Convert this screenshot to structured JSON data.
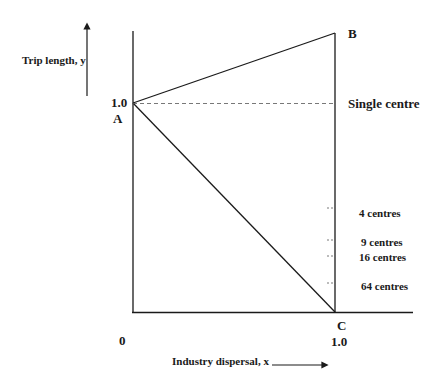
{
  "diagram": {
    "y_axis_label": "Trip length, y",
    "x_axis_label": "Industry dispersal, x",
    "origin_label": "0",
    "y_value_label": "1.0",
    "x_value_label": "1.0",
    "points": {
      "A": "A",
      "B": "B",
      "C": "C"
    },
    "reference_line_label": "Single centre",
    "centre_levels": [
      {
        "label": "4 centres"
      },
      {
        "label": "9 centres"
      },
      {
        "label": "16 centres"
      },
      {
        "label": "64 centres"
      }
    ],
    "colors": {
      "line": "#1a1a1a",
      "dashed": "#555555",
      "background": "#ffffff"
    }
  }
}
